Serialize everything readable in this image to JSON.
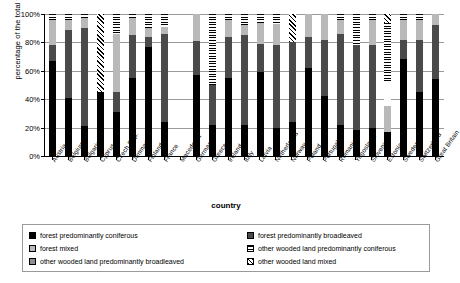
{
  "chart_data": {
    "type": "bar",
    "subtype": "stacked-100-percent",
    "title": "",
    "xlabel": "country",
    "ylabel": "percentage of the total forest surface",
    "ylim": [
      0,
      100
    ],
    "ytick_labels": [
      "0%",
      "20%",
      "40%",
      "60%",
      "80%",
      "100%"
    ],
    "ytick_values": [
      0,
      20,
      40,
      60,
      80,
      100
    ],
    "grid": true,
    "legend_position": "bottom",
    "categories": [
      "Austria",
      "Belgium",
      "Bulgaria",
      "Cyprus",
      "Czech Rep.",
      "Denmark",
      "Finland",
      "France",
      "Macedonia",
      "Germany",
      "Greece",
      "Ireland",
      "Italy",
      "Latvia",
      "Netherlands",
      "Norway",
      "Poland",
      "Portugal",
      "Romania",
      "Yugoslavia",
      "Slovenia",
      "Estonia",
      "Sweden",
      "Switzerland",
      "Great Britain"
    ],
    "series": [
      {
        "name": "forest  predominantly coniferous",
        "fill": "solid-black",
        "values": [
          67,
          41,
          21,
          0,
          45,
          31,
          77,
          55,
          0,
          76,
          24,
          0,
          0,
          57,
          22,
          0,
          0,
          0,
          0,
          0,
          0,
          0,
          0,
          0,
          0
        ]
      },
      {
        "name": "forest  predominantly broadleaved",
        "fill": "dark-grey",
        "values": [
          11,
          48,
          69,
          0,
          31,
          13,
          7,
          29,
          0,
          8,
          58,
          0,
          0,
          25,
          58,
          0,
          0,
          0,
          0,
          0,
          0,
          0,
          0,
          0,
          0
        ]
      },
      {
        "name": "forest  mixed",
        "fill": "light-grey",
        "values": [
          18,
          8,
          7,
          0,
          0,
          51,
          13,
          12,
          0,
          10,
          14,
          0,
          0,
          16,
          13,
          0,
          0,
          0,
          0,
          0,
          0,
          0,
          0,
          0,
          0
        ]
      },
      {
        "name": "other wooded land  predominantly coniferous",
        "fill": "horizontal-stripe",
        "values": [
          4,
          3,
          3,
          0,
          0,
          5,
          3,
          4,
          0,
          6,
          4,
          0,
          0,
          2,
          7,
          0,
          0,
          0,
          0,
          0,
          0,
          0,
          0,
          0,
          0
        ]
      },
      {
        "name": "other wooded land predominantly broadleaved",
        "fill": "mid-grey",
        "values": [
          0,
          0,
          0,
          0,
          24,
          0,
          0,
          0,
          0,
          0,
          0,
          0,
          0,
          0,
          0,
          0,
          0,
          0,
          0,
          0,
          0,
          0,
          0,
          0,
          0
        ]
      },
      {
        "name": "other wooded land  mixed",
        "fill": "diagonal-hatch",
        "values": [
          0,
          0,
          0,
          55,
          0,
          0,
          0,
          0,
          0,
          0,
          0,
          0,
          0,
          0,
          0,
          0,
          0,
          0,
          0,
          0,
          0,
          0,
          0,
          0,
          0
        ]
      }
    ],
    "bars": [
      {
        "country": "Austria",
        "segments": [
          {
            "fill": "f-black",
            "v": 67
          },
          {
            "fill": "f-dgrey",
            "v": 11
          },
          {
            "fill": "f-lgrey",
            "v": 18
          },
          {
            "fill": "f-hstripe",
            "v": 4
          }
        ]
      },
      {
        "country": "Belgium",
        "segments": [
          {
            "fill": "f-black",
            "v": 41
          },
          {
            "fill": "f-dgrey",
            "v": 48
          },
          {
            "fill": "f-lgrey",
            "v": 7
          },
          {
            "fill": "f-hstripe",
            "v": 4
          }
        ]
      },
      {
        "country": "Bulgaria",
        "segments": [
          {
            "fill": "f-black",
            "v": 21
          },
          {
            "fill": "f-dgrey",
            "v": 69
          },
          {
            "fill": "f-lgrey",
            "v": 7
          },
          {
            "fill": "f-hstripe",
            "v": 3
          }
        ]
      },
      {
        "country": "Cyprus",
        "segments": [
          {
            "fill": "f-black",
            "v": 45
          },
          {
            "fill": "f-diag",
            "v": 55
          }
        ]
      },
      {
        "country": "Czech Rep.",
        "segments": [
          {
            "fill": "f-black",
            "v": 31
          },
          {
            "fill": "f-dgrey",
            "v": 14
          },
          {
            "fill": "f-lgrey",
            "v": 41
          },
          {
            "fill": "f-hstripe",
            "v": 14
          }
        ]
      },
      {
        "country": "Denmark",
        "segments": [
          {
            "fill": "f-black",
            "v": 55
          },
          {
            "fill": "f-dgrey",
            "v": 30
          },
          {
            "fill": "f-lgrey",
            "v": 12
          },
          {
            "fill": "f-hstripe",
            "v": 3
          }
        ]
      },
      {
        "country": "Finland",
        "segments": [
          {
            "fill": "f-black",
            "v": 77
          },
          {
            "fill": "f-dgrey",
            "v": 7
          },
          {
            "fill": "f-lgrey",
            "v": 6
          },
          {
            "fill": "f-hstripe",
            "v": 10
          }
        ]
      },
      {
        "country": "France",
        "segments": [
          {
            "fill": "f-black",
            "v": 24
          },
          {
            "fill": "f-dgrey",
            "v": 62
          },
          {
            "fill": "f-lgrey",
            "v": 5
          },
          {
            "fill": "f-hstripe",
            "v": 9
          }
        ]
      },
      {
        "country": "Macedonia",
        "segments": []
      },
      {
        "country": "Germany",
        "segments": [
          {
            "fill": "f-black",
            "v": 57
          },
          {
            "fill": "f-dgrey",
            "v": 24
          },
          {
            "fill": "f-lgrey",
            "v": 19
          }
        ]
      },
      {
        "country": "Greece",
        "segments": [
          {
            "fill": "f-black",
            "v": 22
          },
          {
            "fill": "f-dgrey",
            "v": 28
          },
          {
            "fill": "f-hstripe",
            "v": 50
          }
        ]
      },
      {
        "country": "Ireland",
        "segments": [
          {
            "fill": "f-black",
            "v": 55
          },
          {
            "fill": "f-dgrey",
            "v": 29
          },
          {
            "fill": "f-lgrey",
            "v": 12
          },
          {
            "fill": "f-hstripe",
            "v": 4
          }
        ]
      },
      {
        "country": "Italy",
        "segments": [
          {
            "fill": "f-black",
            "v": 22
          },
          {
            "fill": "f-dgrey",
            "v": 63
          },
          {
            "fill": "f-lgrey",
            "v": 7
          },
          {
            "fill": "f-hstripe",
            "v": 8
          }
        ]
      },
      {
        "country": "Latvia",
        "segments": [
          {
            "fill": "f-black",
            "v": 59
          },
          {
            "fill": "f-dgrey",
            "v": 20
          },
          {
            "fill": "f-lgrey",
            "v": 15
          },
          {
            "fill": "f-hstripe",
            "v": 6
          }
        ]
      },
      {
        "country": "Netherlands",
        "segments": [
          {
            "fill": "f-black",
            "v": 20
          },
          {
            "fill": "f-dgrey",
            "v": 58
          },
          {
            "fill": "f-lgrey",
            "v": 15
          },
          {
            "fill": "f-hstripe",
            "v": 7
          }
        ]
      },
      {
        "country": "Norway",
        "segments": [
          {
            "fill": "f-black",
            "v": 24
          },
          {
            "fill": "f-dgrey",
            "v": 56
          },
          {
            "fill": "f-diag",
            "v": 20
          }
        ]
      },
      {
        "country": "Poland",
        "segments": [
          {
            "fill": "f-black",
            "v": 62
          },
          {
            "fill": "f-dgrey",
            "v": 22
          },
          {
            "fill": "f-lgrey",
            "v": 16
          }
        ]
      },
      {
        "country": "Portugal",
        "segments": [
          {
            "fill": "f-black",
            "v": 42
          },
          {
            "fill": "f-dgrey",
            "v": 40
          },
          {
            "fill": "f-lgrey",
            "v": 18
          }
        ]
      },
      {
        "country": "Romania",
        "segments": [
          {
            "fill": "f-black",
            "v": 22
          },
          {
            "fill": "f-dgrey",
            "v": 64
          },
          {
            "fill": "f-lgrey",
            "v": 10
          },
          {
            "fill": "f-hstripe",
            "v": 4
          }
        ]
      },
      {
        "country": "Yugoslavia",
        "segments": [
          {
            "fill": "f-black",
            "v": 18
          },
          {
            "fill": "f-dgrey",
            "v": 60
          },
          {
            "fill": "f-hstripe",
            "v": 22
          }
        ]
      },
      {
        "country": "Slovenia",
        "segments": [
          {
            "fill": "f-black",
            "v": 20
          },
          {
            "fill": "f-dgrey",
            "v": 58
          },
          {
            "fill": "f-lgrey",
            "v": 18
          },
          {
            "fill": "f-hstripe",
            "v": 4
          }
        ]
      },
      {
        "country": "Estonia",
        "segments": [
          {
            "fill": "f-black",
            "v": 17
          },
          {
            "fill": "f-lgrey",
            "v": 18
          },
          {
            "fill": "f-white",
            "v": 18
          },
          {
            "fill": "f-hstripe",
            "v": 41
          },
          {
            "fill": "f-diag",
            "v": 6
          }
        ]
      },
      {
        "country": "Sweden",
        "segments": [
          {
            "fill": "f-black",
            "v": 68
          },
          {
            "fill": "f-dgrey",
            "v": 14
          },
          {
            "fill": "f-lgrey",
            "v": 14
          },
          {
            "fill": "f-hstripe",
            "v": 4
          }
        ]
      },
      {
        "country": "Switzerland",
        "segments": [
          {
            "fill": "f-black",
            "v": 45
          },
          {
            "fill": "f-dgrey",
            "v": 37
          },
          {
            "fill": "f-lgrey",
            "v": 14
          },
          {
            "fill": "f-hstripe",
            "v": 4
          }
        ]
      },
      {
        "country": "Great Britain",
        "segments": [
          {
            "fill": "f-black",
            "v": 54
          },
          {
            "fill": "f-dgrey",
            "v": 38
          },
          {
            "fill": "f-lgrey",
            "v": 8
          }
        ]
      }
    ]
  },
  "legend": {
    "left_column": [
      {
        "label": "forest  predominantly coniferous",
        "swatch": "f-black"
      },
      {
        "label": "forest  mixed",
        "swatch": "f-lgrey"
      },
      {
        "label": "other wooded land predominantly broadleaved",
        "swatch": "f-mgrey"
      }
    ],
    "right_column": [
      {
        "label": "forest  predominantly broadleaved",
        "swatch": "f-dgrey"
      },
      {
        "label": "other wooded land  predominantly coniferous",
        "swatch": "f-hstripe"
      },
      {
        "label": "other wooded land  mixed",
        "swatch": "f-diag"
      }
    ]
  },
  "colors": {
    "grid": "#9a9a9a",
    "axis": "#000000",
    "coniferous": "#000000",
    "broadleaved": "#4a4a4a",
    "mixed": "#b9b9b9",
    "owl_broadleaved": "#8f8f8f",
    "background": "#ffffff"
  }
}
